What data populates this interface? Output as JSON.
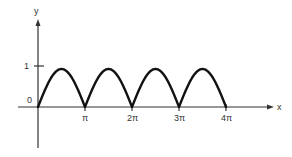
{
  "chart_data": {
    "type": "line",
    "title": "",
    "xlabel": "x",
    "ylabel": "y",
    "function": "y = |sin x|",
    "x_ticks": [
      "π",
      "2π",
      "3π",
      "4π"
    ],
    "x_tick_values": [
      3.1416,
      6.2832,
      9.4248,
      12.5664
    ],
    "y_ticks": [
      "0",
      "1"
    ],
    "y_tick_values": [
      0,
      1
    ],
    "xlim": [
      0,
      12.5664
    ],
    "ylim": [
      0,
      1
    ],
    "grid": false,
    "legend": null,
    "series": [
      {
        "name": "|sin x|",
        "x": [
          0,
          0.785,
          1.571,
          2.356,
          3.142,
          3.927,
          4.712,
          5.498,
          6.283,
          7.069,
          7.854,
          8.639,
          9.425,
          10.21,
          10.996,
          11.781,
          12.566
        ],
        "values": [
          0,
          0.707,
          1,
          0.707,
          0,
          0.707,
          1,
          0.707,
          0,
          0.707,
          1,
          0.707,
          0,
          0.707,
          1,
          0.707,
          0
        ]
      }
    ]
  },
  "axes": {
    "x_label": "x",
    "y_label": "y",
    "origin_label": "0",
    "y_tick_1_label": "1",
    "x_tick_labels": [
      "π",
      "2π",
      "3π",
      "4π"
    ]
  },
  "colors": {
    "curve": "#111111",
    "axis": "#333333",
    "text": "#333333"
  }
}
